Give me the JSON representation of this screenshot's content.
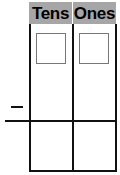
{
  "place_value_chart": {
    "columns": [
      {
        "label": "Tens"
      },
      {
        "label": "Ones"
      }
    ],
    "operator": "−",
    "header_color": "#a6a6a6",
    "line_color": "#111111",
    "answer_boxes": [
      {
        "column": "Tens",
        "value": ""
      },
      {
        "column": "Ones",
        "value": ""
      }
    ]
  }
}
